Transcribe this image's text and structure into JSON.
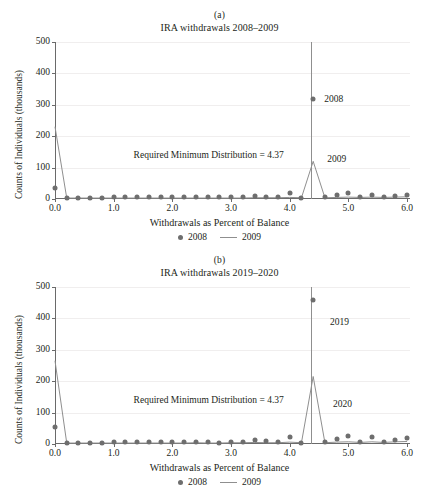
{
  "figure": {
    "panels": [
      {
        "letter": "(a)",
        "title": "IRA withdrawals 2008–2009",
        "xlabel": "Withdrawals as Percent of Balance",
        "ylabel": "Counts of Individuals (thousands)",
        "annotation": "Required Minimum Distribution = 4.37",
        "note_scatter": "2008",
        "note_line": "2009",
        "legend": [
          {
            "label": "2008",
            "marker": "dot"
          },
          {
            "label": "2009",
            "marker": "line"
          }
        ]
      },
      {
        "letter": "(b)",
        "title": "IRA withdrawals 2019–2020",
        "xlabel": "Withdrawals as Percent of Balance",
        "ylabel": "Counts of Individuals (thousands)",
        "annotation": "Required Minimum Distribution = 4.37",
        "note_scatter": "2019",
        "note_line": "2020",
        "legend": [
          {
            "label": "2008",
            "marker": "dot"
          },
          {
            "label": "2009",
            "marker": "line"
          }
        ]
      }
    ]
  },
  "style": {
    "marker_color": "#6e6e6e",
    "line_color": "#8f8f8f",
    "grid_color": "#f0eeee",
    "axis_color": "#6a6a6a",
    "text_color": "#231f20"
  },
  "chart_data": [
    {
      "type": "scatter",
      "panel": "(a)",
      "title": "IRA withdrawals 2008–2009",
      "xlabel": "Withdrawals as Percent of Balance",
      "ylabel": "Counts of Individuals (thousands)",
      "xlim": [
        0.0,
        6.05
      ],
      "ylim": [
        0,
        500
      ],
      "xticks": [
        0.0,
        1.0,
        2.0,
        3.0,
        4.0,
        5.0,
        6.0
      ],
      "xtick_labels": [
        "0.0",
        "1.0",
        "2.0",
        "3.0",
        "4.0",
        "5.0",
        "6.0"
      ],
      "yticks": [
        0,
        100,
        200,
        300,
        400,
        500
      ],
      "ytick_labels": [
        "0",
        "100",
        "200",
        "300",
        "400",
        "500"
      ],
      "grid": "horizontal",
      "legend_position": "below-axis-center",
      "reference_line": {
        "x": 4.37,
        "label": "Required Minimum Distribution = 4.37"
      },
      "x": [
        0.0,
        0.2,
        0.4,
        0.6,
        0.8,
        1.0,
        1.2,
        1.4,
        1.6,
        1.8,
        2.0,
        2.2,
        2.4,
        2.6,
        2.8,
        3.0,
        3.2,
        3.4,
        3.6,
        3.8,
        4.0,
        4.2,
        4.4,
        4.6,
        4.8,
        5.0,
        5.2,
        5.4,
        5.6,
        5.8,
        6.0
      ],
      "series": [
        {
          "name": "2008",
          "marker": "dot",
          "values": [
            35,
            4,
            4,
            4,
            4,
            5,
            5,
            5,
            5,
            5,
            5,
            5,
            6,
            6,
            5,
            6,
            6,
            10,
            7,
            6,
            19,
            4,
            320,
            5,
            14,
            18,
            6,
            13,
            7,
            10,
            12
          ]
        },
        {
          "name": "2009",
          "marker": "line",
          "values": [
            230,
            3,
            3,
            3,
            3,
            3,
            3,
            3,
            3,
            3,
            3,
            3,
            3,
            3,
            3,
            3,
            3,
            4,
            4,
            4,
            5,
            4,
            120,
            4,
            5,
            6,
            5,
            6,
            5,
            6,
            7
          ]
        }
      ],
      "annotations": [
        {
          "text": "2008",
          "x": 4.75,
          "y": 318
        },
        {
          "text": "2009",
          "x": 4.8,
          "y": 128
        }
      ]
    },
    {
      "type": "scatter",
      "panel": "(b)",
      "title": "IRA withdrawals 2019–2020",
      "xlabel": "Withdrawals as Percent of Balance",
      "ylabel": "Counts of Individuals (thousands)",
      "xlim": [
        0.0,
        6.05
      ],
      "ylim": [
        0,
        500
      ],
      "xticks": [
        0.0,
        1.0,
        2.0,
        3.0,
        4.0,
        5.0,
        6.0
      ],
      "xtick_labels": [
        "0.0",
        "1.0",
        "2.0",
        "3.0",
        "4.0",
        "5.0",
        "6.0"
      ],
      "yticks": [
        0,
        100,
        200,
        300,
        400,
        500
      ],
      "ytick_labels": [
        "0",
        "100",
        "200",
        "300",
        "400",
        "500"
      ],
      "grid": "horizontal",
      "legend_position": "below-axis-center",
      "reference_line": {
        "x": 4.37,
        "label": "Required Minimum Distribution = 4.37"
      },
      "x": [
        0.0,
        0.2,
        0.4,
        0.6,
        0.8,
        1.0,
        1.2,
        1.4,
        1.6,
        1.8,
        2.0,
        2.2,
        2.4,
        2.6,
        2.8,
        3.0,
        3.2,
        3.4,
        3.6,
        3.8,
        4.0,
        4.2,
        4.4,
        4.6,
        4.8,
        5.0,
        5.2,
        5.4,
        5.6,
        5.8,
        6.0
      ],
      "series": [
        {
          "name": "2019",
          "marker": "dot",
          "values": [
            55,
            4,
            4,
            4,
            4,
            5,
            5,
            5,
            5,
            5,
            5,
            5,
            7,
            6,
            4,
            6,
            7,
            12,
            9,
            5,
            22,
            4,
            460,
            5,
            16,
            24,
            6,
            21,
            7,
            12,
            20
          ]
        },
        {
          "name": "2020",
          "marker": "line",
          "values": [
            265,
            3,
            3,
            3,
            3,
            3,
            3,
            3,
            3,
            3,
            3,
            3,
            4,
            3,
            3,
            4,
            4,
            5,
            4,
            4,
            6,
            4,
            215,
            4,
            6,
            7,
            5,
            7,
            5,
            7,
            8
          ]
        }
      ],
      "annotations": [
        {
          "text": "2019",
          "x": 4.85,
          "y": 390
        },
        {
          "text": "2020",
          "x": 4.9,
          "y": 128
        }
      ]
    }
  ]
}
